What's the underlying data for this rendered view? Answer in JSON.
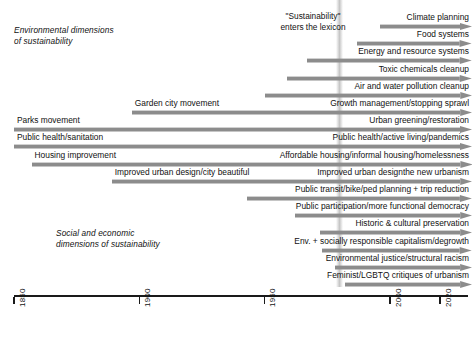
{
  "figure": {
    "type": "timeline",
    "background": "#ffffff",
    "arrow_color": "#8c8c8c",
    "axis_color": "#1a1a1a",
    "band_color": "#bcbcbc"
  },
  "annotation": {
    "lexicon_note": "\"Sustainability\"\nenters the lexicon",
    "lexicon_year": 1980
  },
  "sections": [
    {
      "id": "environmental",
      "caption": "Environmental dimensions\nof sustainability"
    },
    {
      "id": "social-economic",
      "caption": "Social and economic\ndimensions of sustainability"
    }
  ],
  "axis": {
    "start_year": 1850,
    "end_year": 2030,
    "ticks": [
      {
        "year": 1850,
        "label": "1850"
      },
      {
        "year": 1900,
        "label": "1900"
      },
      {
        "year": 1950,
        "label": "1950"
      },
      {
        "year": 2000,
        "label": "2000"
      },
      {
        "year": 2020,
        "label": "2020"
      }
    ]
  },
  "chart_data": {
    "type": "timeline",
    "title": "",
    "xlabel": "",
    "ylabel": "",
    "xlim": [
      1850,
      2030
    ],
    "grid": false,
    "legend": "none",
    "rows": [
      {
        "id": "climate-planning",
        "left_label": "",
        "right_label": "Climate planning",
        "start_year": 1996
      },
      {
        "id": "food-systems",
        "left_label": "",
        "right_label": "Food systems",
        "start_year": 1987
      },
      {
        "id": "energy-resources",
        "left_label": "",
        "right_label": "Energy and resource systems",
        "start_year": 1967
      },
      {
        "id": "toxic-chemicals",
        "left_label": "",
        "right_label": "Toxic chemicals cleanup",
        "start_year": 1959
      },
      {
        "id": "air-water-pollution",
        "left_label": "",
        "right_label": "Air and water pollution cleanup",
        "start_year": 1950
      },
      {
        "id": "growth-management",
        "left_label": "Garden city movement",
        "right_label": "Growth management/stopping sprawl",
        "start_year": 1897
      },
      {
        "id": "urban-greening",
        "left_label": "Parks movement",
        "right_label": "Urban greening/restoration",
        "start_year": 1850
      },
      {
        "id": "public-health",
        "left_label": "Public health/sanitation",
        "right_label": "Public health/active living/pandemics",
        "start_year": 1850
      },
      {
        "id": "affordable-housing",
        "left_label": "Housing improvement",
        "right_label": "Affordable housing/informal housing/homelessness",
        "start_year": 1857
      },
      {
        "id": "urban-design",
        "left_label": "Improved urban design/city beautiful",
        "right_label": "Improved urban designthe new urbanism",
        "start_year": 1889
      },
      {
        "id": "public-transit",
        "left_label": "",
        "right_label": "Public transit/bike/ped planning + trip reduction",
        "start_year": 1943
      },
      {
        "id": "public-participation",
        "left_label": "",
        "right_label": "Public participation/more functional democracy",
        "start_year": 1962
      },
      {
        "id": "historic-preservation",
        "left_label": "",
        "right_label": "Historic & cultural preservation",
        "start_year": 1972
      },
      {
        "id": "responsible-capitalism",
        "left_label": "",
        "right_label": "Env. + socially responsible capitalism/degrowth",
        "start_year": 1973
      },
      {
        "id": "environmental-justice",
        "left_label": "",
        "right_label": "Environmental justice/structural racism",
        "start_year": 1978
      },
      {
        "id": "feminist-lgbtq",
        "left_label": "",
        "right_label": "Feminist/LGBTQ critiques of urbanism",
        "start_year": 1982
      }
    ]
  }
}
